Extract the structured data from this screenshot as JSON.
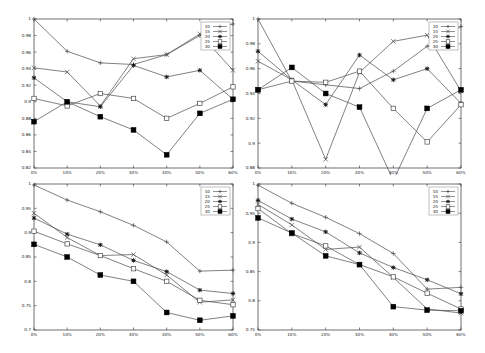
{
  "chart_data": [
    {
      "type": "line",
      "panel": "top-left",
      "title": "",
      "xlabel": "",
      "ylabel": "",
      "categories": [
        "0%",
        "10%",
        "20%",
        "30%",
        "40%",
        "50%",
        "60%"
      ],
      "ylim": [
        0.82,
        1.0
      ],
      "yticks": [
        "0.82",
        "0.84",
        "0.86",
        "0.88",
        "0.9",
        "0.92",
        "0.94",
        "0.96",
        "0.98",
        "1"
      ],
      "grid": false,
      "legend_position": "top-right-inside",
      "series": [
        {
          "name": "10",
          "marker": "plus",
          "values": [
            1.0,
            0.961,
            0.947,
            0.945,
            0.957,
            0.98,
            0.994
          ]
        },
        {
          "name": "15",
          "marker": "cross",
          "values": [
            0.941,
            0.936,
            0.895,
            0.952,
            0.957,
            0.982,
            0.938
          ]
        },
        {
          "name": "20",
          "marker": "star",
          "values": [
            0.929,
            0.9,
            0.894,
            0.944,
            0.93,
            0.938,
            0.903
          ]
        },
        {
          "name": "25",
          "marker": "open-square",
          "values": [
            0.904,
            0.895,
            0.91,
            0.904,
            0.88,
            0.898,
            0.918
          ]
        },
        {
          "name": "30",
          "marker": "filled-square",
          "values": [
            0.876,
            0.9,
            0.882,
            0.866,
            0.836,
            0.886,
            0.903
          ]
        }
      ]
    },
    {
      "type": "line",
      "panel": "top-right",
      "title": "",
      "xlabel": "",
      "ylabel": "",
      "categories": [
        "0%",
        "10%",
        "20%",
        "30%",
        "40%",
        "50%",
        "60%"
      ],
      "ylim": [
        0.88,
        1.0
      ],
      "yticks": [
        "0.88",
        "0.9",
        "0.92",
        "0.94",
        "0.96",
        "0.98",
        "1"
      ],
      "grid": false,
      "legend_position": "top-right-inside",
      "series": [
        {
          "name": "10",
          "marker": "plus",
          "values": [
            1.0,
            0.95,
            0.947,
            0.944,
            0.958,
            0.978,
            0.994
          ]
        },
        {
          "name": "15",
          "marker": "cross",
          "values": [
            0.966,
            0.951,
            0.887,
            0.957,
            0.982,
            0.987,
            0.942
          ]
        },
        {
          "name": "20",
          "marker": "star",
          "values": [
            0.974,
            0.951,
            0.931,
            0.971,
            0.951,
            0.96,
            0.932
          ]
        },
        {
          "name": "25",
          "marker": "open-square",
          "values": [
            0.943,
            0.95,
            0.949,
            0.958,
            0.928,
            0.901,
            0.931
          ]
        },
        {
          "name": "30",
          "marker": "filled-square",
          "values": [
            0.943,
            0.961,
            0.94,
            0.929,
            0.87,
            0.928,
            0.943
          ]
        }
      ]
    },
    {
      "type": "line",
      "panel": "bottom-left",
      "title": "",
      "xlabel": "",
      "ylabel": "",
      "categories": [
        "0%",
        "10%",
        "20%",
        "30%",
        "40%",
        "50%",
        "60%"
      ],
      "ylim": [
        0.7,
        1.0
      ],
      "yticks": [
        "0.7",
        "0.75",
        "0.8",
        "0.85",
        "0.9",
        "0.95",
        "1"
      ],
      "grid": false,
      "legend_position": "top-right-inside",
      "series": [
        {
          "name": "10",
          "marker": "plus",
          "values": [
            0.998,
            0.967,
            0.943,
            0.915,
            0.881,
            0.821,
            0.823
          ]
        },
        {
          "name": "15",
          "marker": "cross",
          "values": [
            0.94,
            0.89,
            0.853,
            0.855,
            0.813,
            0.757,
            0.762
          ]
        },
        {
          "name": "20",
          "marker": "star",
          "values": [
            0.93,
            0.897,
            0.875,
            0.843,
            0.82,
            0.782,
            0.775
          ]
        },
        {
          "name": "25",
          "marker": "open-square",
          "values": [
            0.903,
            0.877,
            0.853,
            0.826,
            0.8,
            0.761,
            0.752
          ]
        },
        {
          "name": "30",
          "marker": "filled-square",
          "values": [
            0.876,
            0.85,
            0.813,
            0.8,
            0.736,
            0.72,
            0.729
          ]
        }
      ]
    },
    {
      "type": "line",
      "panel": "bottom-right",
      "title": "",
      "xlabel": "",
      "ylabel": "",
      "categories": [
        "0%",
        "10%",
        "20%",
        "30%",
        "40%",
        "50%",
        "60%"
      ],
      "ylim": [
        0.75,
        1.0
      ],
      "yticks": [
        "0.75",
        "0.8",
        "0.85",
        "0.9",
        "0.95",
        "1"
      ],
      "grid": false,
      "legend_position": "top-right-inside",
      "series": [
        {
          "name": "10",
          "marker": "plus",
          "values": [
            0.998,
            0.967,
            0.943,
            0.915,
            0.881,
            0.82,
            0.823
          ]
        },
        {
          "name": "15",
          "marker": "cross",
          "values": [
            0.965,
            0.93,
            0.888,
            0.892,
            0.84,
            0.786,
            0.779
          ]
        },
        {
          "name": "20",
          "marker": "star",
          "values": [
            0.972,
            0.94,
            0.918,
            0.882,
            0.857,
            0.836,
            0.812
          ]
        },
        {
          "name": "25",
          "marker": "open-square",
          "values": [
            0.958,
            0.915,
            0.894,
            0.862,
            0.841,
            0.813,
            0.786
          ]
        },
        {
          "name": "30",
          "marker": "filled-square",
          "values": [
            0.942,
            0.916,
            0.877,
            0.862,
            0.79,
            0.784,
            0.783
          ]
        }
      ]
    }
  ],
  "panels": [
    {
      "id": "top-left",
      "left": 0,
      "top": 0,
      "width": 245,
      "height": 175,
      "frame": {
        "x0": 34,
        "x1": 233,
        "y0": 19,
        "y1": 168
      }
    },
    {
      "id": "top-right",
      "left": 245,
      "top": 0,
      "width": 240,
      "height": 175,
      "frame": {
        "x0": 13,
        "x1": 216,
        "y0": 19,
        "y1": 168
      }
    },
    {
      "id": "bottom-left",
      "left": 0,
      "top": 175,
      "width": 245,
      "height": 178,
      "frame": {
        "x0": 34,
        "x1": 233,
        "y0": 9,
        "y1": 155
      }
    },
    {
      "id": "bottom-right",
      "left": 245,
      "top": 175,
      "width": 240,
      "height": 178,
      "frame": {
        "x0": 13,
        "x1": 216,
        "y0": 9,
        "y1": 155
      }
    }
  ],
  "style": {
    "line_color": "#4a4a4a",
    "frame_color": "#333333",
    "text_color": "#222222",
    "background": "#ffffff"
  }
}
